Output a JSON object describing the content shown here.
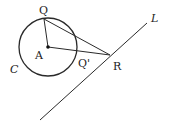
{
  "diagram": {
    "type": "geometry",
    "colors": {
      "stroke": "#2a2a2a",
      "background": "#ffffff"
    },
    "circle": {
      "name": "C",
      "center": "A",
      "cx": 48,
      "cy": 47,
      "r": 29
    },
    "points": {
      "A": {
        "label": "A",
        "x": 48,
        "y": 47
      },
      "Q": {
        "label": "Q",
        "x": 44,
        "y": 19
      },
      "Q_prime": {
        "label": "Q'",
        "x": 77,
        "y": 51
      },
      "R": {
        "label": "R",
        "x": 110,
        "y": 55
      }
    },
    "line": {
      "label": "L",
      "x1": 147,
      "y1": 23,
      "x2": 40,
      "y2": 120
    },
    "labels": {
      "Q": "Q",
      "A": "A",
      "Q_prime": "Q'",
      "R": "R",
      "C": "C",
      "L": "L"
    }
  }
}
